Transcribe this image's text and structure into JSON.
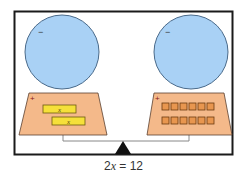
{
  "diagram": {
    "type": "balance-scale-algebra-tiles",
    "equation": {
      "coefficient": "2",
      "variable": "x",
      "equals": " = ",
      "constant": "12"
    },
    "colors": {
      "frame": "#1a1a1a",
      "balloon_fill": "#a9d1f5",
      "balloon_stroke": "#4a6a8a",
      "tray_fill": "#f4b98a",
      "tray_stroke": "#5a4030",
      "x_tile_fill": "#f5e03a",
      "x_tile_stroke": "#6b5a10",
      "unit_tile_fill": "#e8964f",
      "unit_tile_stroke": "#6b3a10",
      "fulcrum": "#111111"
    },
    "left_side": {
      "balloon_label": "−",
      "tray_label": "+",
      "tiles": [
        {
          "kind": "x",
          "label": "x"
        },
        {
          "kind": "x",
          "label": "x"
        }
      ]
    },
    "right_side": {
      "balloon_label": "−",
      "tray_label": "+",
      "unit_tile_rows": 2,
      "unit_tile_cols": 6,
      "unit_tile_count": 12
    }
  }
}
